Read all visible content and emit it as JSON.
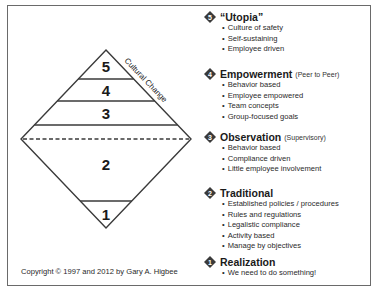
{
  "diagram": {
    "levels": [
      {
        "number": "5"
      },
      {
        "number": "4"
      },
      {
        "number": "3"
      },
      {
        "number": "2"
      },
      {
        "number": "1"
      }
    ],
    "axis_label": "Cultural Change",
    "copyright": "Copyright © 1997 and 2012 by Gary A. Higbee",
    "colors": {
      "line": "#3a3a3a",
      "badge": "#3a3a3a",
      "frame": "#6a6a6a"
    }
  },
  "stages": [
    {
      "number": "5",
      "title": "“Utopia”",
      "subtitle": "",
      "bullets": [
        "Culture of safety",
        "Self-sustaining",
        "Employee driven"
      ]
    },
    {
      "number": "4",
      "title": "Empowerment",
      "subtitle": "(Peer to Peer)",
      "bullets": [
        "Behavior based",
        "Employee empowered",
        "Team concepts",
        "Group-focused goals"
      ]
    },
    {
      "number": "3",
      "title": "Observation",
      "subtitle": "(Supervisory)",
      "bullets": [
        "Behavior based",
        "Compliance driven",
        "Little employee involvement"
      ]
    },
    {
      "number": "2",
      "title": "Traditional",
      "subtitle": "",
      "bullets": [
        "Established policies / procedures",
        "Rules and regulations",
        "Legalistic compliance",
        "Activity based",
        "Manage by objectives"
      ]
    },
    {
      "number": "1",
      "title": "Realization",
      "subtitle": "",
      "bullets": [
        "We need to do something!"
      ]
    }
  ]
}
